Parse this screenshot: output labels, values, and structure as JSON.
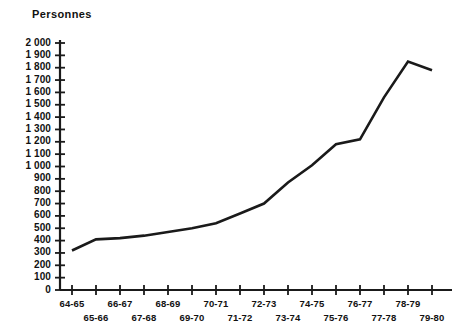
{
  "chart_data": {
    "type": "line",
    "title": "",
    "ylabel": "Personnes",
    "xlabel": "",
    "grid": false,
    "legend": "none",
    "ylim": [
      0,
      2000
    ],
    "ytick_step": 100,
    "yticks": [
      "0",
      "100",
      "200",
      "300",
      "400",
      "500",
      "600",
      "700",
      "800",
      "900",
      "1 000",
      "1 100",
      "1 200",
      "1 300",
      "1 400",
      "1 500",
      "1 600",
      "1 700",
      "1 800",
      "1 900",
      "2 000"
    ],
    "categories": [
      "64-65",
      "65-66",
      "66-67",
      "67-68",
      "68-69",
      "69-70",
      "70-71",
      "71-72",
      "72-73",
      "73-74",
      "74-75",
      "75-76",
      "76-77",
      "77-78",
      "78-79",
      "79-80"
    ],
    "values": [
      320,
      410,
      420,
      440,
      470,
      500,
      540,
      620,
      700,
      870,
      1010,
      1180,
      1220,
      1560,
      1850,
      1780
    ],
    "series": [
      {
        "name": "Personnes",
        "values": [
          320,
          410,
          420,
          440,
          470,
          500,
          540,
          620,
          700,
          870,
          1010,
          1180,
          1220,
          1560,
          1850,
          1780
        ],
        "color": "#1a1a1a"
      }
    ],
    "axis_color": "#1a1a1a",
    "line_color": "#1a1a1a",
    "line_width": 2.6
  },
  "layout": {
    "plot_left": 72,
    "plot_right": 432,
    "plot_top": 43,
    "plot_bottom": 290,
    "axis_x": 60,
    "axis_bottom_y": 290,
    "axis_top_y": 40,
    "axis_right_x": 452,
    "category_step": 24,
    "xlabel_row_offsets": [
      8,
      22
    ]
  }
}
